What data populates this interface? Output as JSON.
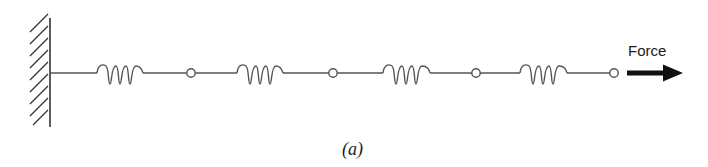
{
  "figure": {
    "caption": "(a)",
    "force_label": "Force",
    "colors": {
      "line": "#555555",
      "wall": "#333333",
      "arrow": "#111111",
      "text": "#1a1a1a"
    },
    "wall": {
      "x": 50,
      "y_top": 18,
      "y_bottom": 127,
      "hatch_count": 9
    },
    "axis_y": 73,
    "springs": [
      {
        "id": 1,
        "x_start": 97,
        "x_end": 143
      },
      {
        "id": 2,
        "x_start": 237,
        "x_end": 283
      },
      {
        "id": 3,
        "x_start": 383,
        "x_end": 430
      },
      {
        "id": 4,
        "x_start": 520,
        "x_end": 567
      }
    ],
    "nodes": [
      {
        "id": 1,
        "x": 191
      },
      {
        "id": 2,
        "x": 333
      },
      {
        "id": 3,
        "x": 476
      },
      {
        "id": 4,
        "x": 614
      }
    ],
    "arrow": {
      "x_start": 627,
      "x_end": 683,
      "direction": "right"
    }
  }
}
